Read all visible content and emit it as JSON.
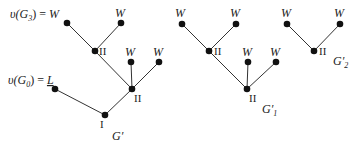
{
  "colors": {
    "node": "#111111",
    "edge": "#333333",
    "text": "#222222",
    "background": "#ffffff"
  },
  "trees": [
    {
      "name": "G'",
      "title": "G′",
      "annotations": [
        {
          "text": "υ(G",
          "sub": "3",
          "rest": ") = ",
          "value": "W"
        },
        {
          "text": "υ(G",
          "sub": "0",
          "rest": ") = ",
          "value": "L"
        }
      ],
      "nodes": [
        {
          "id": "g-w1",
          "label": "W"
        },
        {
          "id": "g-w2",
          "label": "W"
        },
        {
          "id": "g-ii1",
          "label": "II"
        },
        {
          "id": "g-w3",
          "label": "W"
        },
        {
          "id": "g-w4",
          "label": "W"
        },
        {
          "id": "g-ii2",
          "label": "II"
        },
        {
          "id": "g-l",
          "label": "L"
        },
        {
          "id": "g-i",
          "label": "I"
        }
      ]
    },
    {
      "name": "G'1",
      "title": "G′",
      "title_sub": "1",
      "nodes": [
        {
          "id": "g1-w1",
          "label": "W"
        },
        {
          "id": "g1-w2",
          "label": "W"
        },
        {
          "id": "g1-ii1",
          "label": "II"
        },
        {
          "id": "g1-w3",
          "label": "W"
        },
        {
          "id": "g1-w4",
          "label": "W"
        },
        {
          "id": "g1-ii2",
          "label": "II"
        }
      ]
    },
    {
      "name": "G'2",
      "title": "G′",
      "title_sub": "2",
      "nodes": [
        {
          "id": "g2-w1",
          "label": "W"
        },
        {
          "id": "g2-w2",
          "label": "W"
        },
        {
          "id": "g2-ii",
          "label": "II"
        }
      ]
    }
  ]
}
